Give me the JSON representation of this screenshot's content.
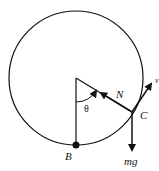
{
  "diagram": {
    "labels": {
      "normal_force": "N",
      "point_c": "C",
      "point_b": "B",
      "weight": "mg",
      "angle": "θ",
      "velocity": "v"
    },
    "colors": {
      "stroke": "#111111",
      "background": "#ffffff"
    }
  }
}
